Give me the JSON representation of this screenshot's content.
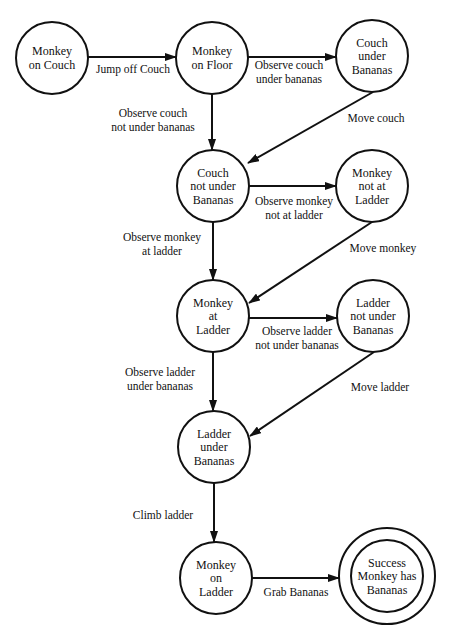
{
  "diagram": {
    "type": "state-machine",
    "colors": {
      "stroke": "#111111",
      "background": "#ffffff",
      "text": "#111111"
    },
    "nodes": [
      {
        "id": "monkey_on_couch",
        "lines": [
          "Monkey",
          "on Couch"
        ],
        "cx": 52,
        "cy": 58,
        "r": 36,
        "final": false
      },
      {
        "id": "monkey_on_floor",
        "lines": [
          "Monkey",
          "on Floor"
        ],
        "cx": 212,
        "cy": 58,
        "r": 36,
        "final": false
      },
      {
        "id": "couch_under_bananas",
        "lines": [
          "Couch",
          "under",
          "Bananas"
        ],
        "cx": 372,
        "cy": 56,
        "r": 36,
        "final": false
      },
      {
        "id": "couch_not_under_bananas",
        "lines": [
          "Couch",
          "not under",
          "Bananas"
        ],
        "cx": 213,
        "cy": 186,
        "r": 36,
        "final": false
      },
      {
        "id": "monkey_not_at_ladder",
        "lines": [
          "Monkey",
          "not at",
          "Ladder"
        ],
        "cx": 372,
        "cy": 186,
        "r": 36,
        "final": false
      },
      {
        "id": "monkey_at_ladder",
        "lines": [
          "Monkey",
          "at",
          "Ladder"
        ],
        "cx": 213,
        "cy": 316,
        "r": 36,
        "final": false
      },
      {
        "id": "ladder_not_under_bananas",
        "lines": [
          "Ladder",
          "not under",
          "Bananas"
        ],
        "cx": 373,
        "cy": 316,
        "r": 36,
        "final": false
      },
      {
        "id": "ladder_under_bananas",
        "lines": [
          "Ladder",
          "under",
          "Bananas"
        ],
        "cx": 214,
        "cy": 447,
        "r": 36,
        "final": false
      },
      {
        "id": "monkey_on_ladder",
        "lines": [
          "Monkey",
          "on",
          "Ladder"
        ],
        "cx": 216,
        "cy": 578,
        "r": 36,
        "final": false
      },
      {
        "id": "success",
        "lines": [
          "Success",
          "Monkey has",
          "Bananas"
        ],
        "cx": 387,
        "cy": 576,
        "r": 36,
        "outer_r": 48,
        "final": true
      }
    ],
    "edges": [
      {
        "from": "monkey_on_couch",
        "to": "monkey_on_floor",
        "lines": [
          "Jump off Couch"
        ],
        "x1": 88,
        "y1": 57,
        "x2": 176,
        "y2": 57,
        "lx": 133,
        "ly": 73
      },
      {
        "from": "monkey_on_floor",
        "to": "couch_under_bananas",
        "lines": [
          "Observe couch",
          "under bananas"
        ],
        "x1": 248,
        "y1": 57,
        "x2": 336,
        "y2": 57,
        "lx": 289,
        "ly": 69
      },
      {
        "from": "monkey_on_floor",
        "to": "couch_not_under_bananas",
        "lines": [
          "Observe couch",
          "not under bananas"
        ],
        "x1": 212,
        "y1": 94,
        "x2": 212,
        "y2": 150,
        "lx": 153,
        "ly": 117
      },
      {
        "from": "couch_under_bananas",
        "to": "couch_not_under_bananas",
        "lines": [
          "Move couch"
        ],
        "x1": 373,
        "y1": 92,
        "x2": 248,
        "y2": 163,
        "lx": 376,
        "ly": 122
      },
      {
        "from": "couch_not_under_bananas",
        "to": "monkey_not_at_ladder",
        "lines": [
          "Observe monkey",
          "not at ladder"
        ],
        "x1": 249,
        "y1": 186,
        "x2": 336,
        "y2": 186,
        "lx": 294,
        "ly": 205
      },
      {
        "from": "couch_not_under_bananas",
        "to": "monkey_at_ladder",
        "lines": [
          "Observe monkey",
          "at ladder"
        ],
        "x1": 213,
        "y1": 222,
        "x2": 213,
        "y2": 280,
        "lx": 162,
        "ly": 241
      },
      {
        "from": "monkey_not_at_ladder",
        "to": "monkey_at_ladder",
        "lines": [
          "Move monkey"
        ],
        "x1": 372,
        "y1": 222,
        "x2": 249,
        "y2": 303,
        "lx": 383,
        "ly": 252
      },
      {
        "from": "monkey_at_ladder",
        "to": "ladder_not_under_bananas",
        "lines": [
          "Observe ladder",
          "not under bananas"
        ],
        "x1": 249,
        "y1": 318,
        "x2": 337,
        "y2": 318,
        "lx": 297,
        "ly": 335
      },
      {
        "from": "monkey_at_ladder",
        "to": "ladder_under_bananas",
        "lines": [
          "Observe ladder",
          "under bananas"
        ],
        "x1": 213,
        "y1": 352,
        "x2": 213,
        "y2": 411,
        "lx": 160,
        "ly": 376
      },
      {
        "from": "ladder_not_under_bananas",
        "to": "ladder_under_bananas",
        "lines": [
          "Move ladder"
        ],
        "x1": 374,
        "y1": 352,
        "x2": 250,
        "y2": 436,
        "lx": 380,
        "ly": 391
      },
      {
        "from": "ladder_under_bananas",
        "to": "monkey_on_ladder",
        "lines": [
          "Climb ladder"
        ],
        "x1": 214,
        "y1": 483,
        "x2": 214,
        "y2": 542,
        "lx": 163,
        "ly": 519
      },
      {
        "from": "monkey_on_ladder",
        "to": "success",
        "lines": [
          "Grab Bananas"
        ],
        "x1": 252,
        "y1": 578,
        "x2": 339,
        "y2": 578,
        "lx": 296,
        "ly": 596
      }
    ]
  }
}
